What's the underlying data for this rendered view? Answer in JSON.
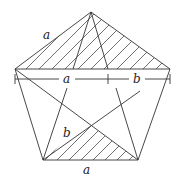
{
  "diagram": {
    "type": "geometric-figure",
    "stroke_color": "#333333",
    "labels": {
      "top_left_side": "a",
      "dimension_a": "a",
      "dimension_b": "b",
      "inner_b": "b",
      "bottom_side": "a"
    },
    "vertices": {
      "apex": [
        91,
        12
      ],
      "left": [
        15,
        69
      ],
      "right": [
        170,
        69
      ],
      "bottom_left": [
        43,
        160
      ],
      "bottom_right": [
        138,
        160
      ]
    }
  }
}
